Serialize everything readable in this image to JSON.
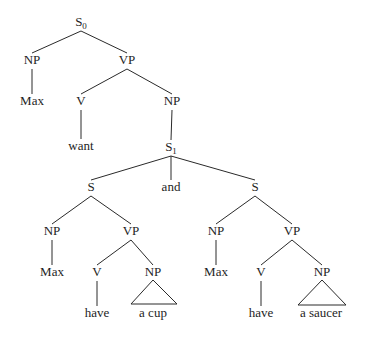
{
  "diagram": {
    "type": "syntax-tree",
    "background": "#ffffff",
    "line_color": "#2a2a2a",
    "text_color": "#1e1e1e",
    "nodes": {
      "s0": {
        "label": "S",
        "sub": "0",
        "x": 81,
        "y": 26
      },
      "np_max": {
        "label": "NP",
        "x": 32,
        "y": 64
      },
      "max_top": {
        "label": "Max",
        "x": 32,
        "y": 105
      },
      "vp_top": {
        "label": "VP",
        "x": 127,
        "y": 64
      },
      "v_want": {
        "label": "V",
        "x": 81,
        "y": 105
      },
      "want": {
        "label": "want",
        "x": 81,
        "y": 150
      },
      "np_obj": {
        "label": "NP",
        "x": 172,
        "y": 105
      },
      "s1": {
        "label": "S",
        "sub": "1",
        "x": 171,
        "y": 151
      },
      "s_left": {
        "label": "S",
        "x": 91,
        "y": 191
      },
      "and": {
        "label": "and",
        "x": 171,
        "y": 191
      },
      "s_right": {
        "label": "S",
        "x": 255,
        "y": 191
      },
      "np_l": {
        "label": "NP",
        "x": 52,
        "y": 235
      },
      "vp_l": {
        "label": "VP",
        "x": 131,
        "y": 235
      },
      "max_l": {
        "label": "Max",
        "x": 52,
        "y": 276
      },
      "v_l": {
        "label": "V",
        "x": 97,
        "y": 276
      },
      "np_l2": {
        "label": "NP",
        "x": 153,
        "y": 276
      },
      "have_l": {
        "label": "have",
        "x": 97,
        "y": 317
      },
      "a_cup": {
        "label": "a cup",
        "x": 153,
        "y": 317
      },
      "np_r": {
        "label": "NP",
        "x": 216,
        "y": 235
      },
      "vp_r": {
        "label": "VP",
        "x": 292,
        "y": 235
      },
      "max_r": {
        "label": "Max",
        "x": 216,
        "y": 276
      },
      "v_r": {
        "label": "V",
        "x": 261,
        "y": 276
      },
      "np_r2": {
        "label": "NP",
        "x": 322,
        "y": 276
      },
      "have_r": {
        "label": "have",
        "x": 261,
        "y": 317
      },
      "a_saucer": {
        "label": "a saucer",
        "x": 321,
        "y": 317
      }
    },
    "edges": [
      [
        "s0",
        "np_max"
      ],
      [
        "s0",
        "vp_top"
      ],
      [
        "np_max",
        "max_top"
      ],
      [
        "vp_top",
        "v_want"
      ],
      [
        "vp_top",
        "np_obj"
      ],
      [
        "v_want",
        "want"
      ],
      [
        "np_obj",
        "s1"
      ],
      [
        "s1",
        "s_left"
      ],
      [
        "s1",
        "and"
      ],
      [
        "s1",
        "s_right"
      ],
      [
        "s_left",
        "np_l"
      ],
      [
        "s_left",
        "vp_l"
      ],
      [
        "np_l",
        "max_l"
      ],
      [
        "vp_l",
        "v_l"
      ],
      [
        "vp_l",
        "np_l2"
      ],
      [
        "v_l",
        "have_l"
      ],
      [
        "s_right",
        "np_r"
      ],
      [
        "s_right",
        "vp_r"
      ],
      [
        "np_r",
        "max_r"
      ],
      [
        "vp_r",
        "v_r"
      ],
      [
        "vp_r",
        "np_r2"
      ],
      [
        "v_r",
        "have_r"
      ]
    ],
    "triangles": [
      {
        "node": "np_l2",
        "apex": [
          153,
          280
        ],
        "base_left": [
          131,
          304
        ],
        "base_right": [
          177,
          304
        ]
      },
      {
        "node": "np_r2",
        "apex": [
          322,
          280
        ],
        "base_left": [
          298,
          305
        ],
        "base_right": [
          346,
          305
        ]
      }
    ]
  }
}
